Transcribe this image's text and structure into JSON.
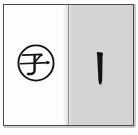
{
  "figure": {
    "panels": [
      {
        "id": "left",
        "background_color": "#fdfdfd",
        "content_type": "circled-character",
        "character": "子",
        "reading_note": "circled kanji",
        "annotation": "encircled"
      },
      {
        "id": "right",
        "background_color": "#d3d5d5",
        "content_type": "brush-stroke",
        "character": "丨",
        "stroke_name": "vertical stroke",
        "stroke_count": 1
      }
    ],
    "border_color": "#4a4a4a",
    "divider_color": "#8e9192",
    "ink_color": "#141414"
  }
}
